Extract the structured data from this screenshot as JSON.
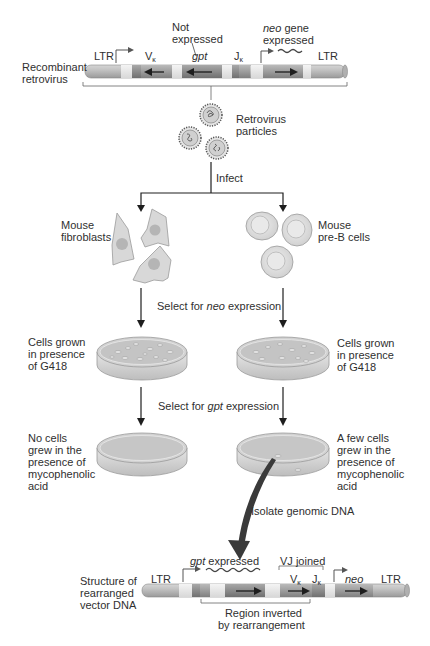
{
  "top_construct": {
    "name_line1": "Recombinant",
    "name_line2": "retrovirus",
    "ltr_left": "LTR",
    "ltr_right": "LTR",
    "v_label": "V",
    "j_label": "J",
    "kappa": "κ",
    "gpt_label": "gpt",
    "not_expressed_line1": "Not",
    "not_expressed_line2": "expressed",
    "neo_label": "neo",
    "neo_expressed_rest": " gene",
    "neo_expressed_line2": "expressed"
  },
  "particles": {
    "line1": "Retrovirus",
    "line2": "particles"
  },
  "infect_label": "Infect",
  "left_branch": {
    "cells_line1": "Mouse",
    "cells_line2": "fibroblasts",
    "plate1_line1": "Cells grown",
    "plate1_line2": "in presence",
    "plate1_line3": "of G418",
    "plate2_line1": "No cells",
    "plate2_line2": "grew in the",
    "plate2_line3": "presence of",
    "plate2_line4": "mycophenolic",
    "plate2_line5": "acid"
  },
  "right_branch": {
    "cells_line1": "Mouse",
    "cells_line2": "pre-B cells",
    "plate1_line1": "Cells grown",
    "plate1_line2": "in presence",
    "plate1_line3": "of G418",
    "plate2_line1": "A few cells",
    "plate2_line2": "grew in the",
    "plate2_line3": "presence of",
    "plate2_line4": "mycophenolic",
    "plate2_line5": "acid"
  },
  "steps": {
    "select_neo_prefix": "Select for ",
    "select_neo_gene": "neo",
    "select_neo_suffix": " expression",
    "select_gpt_prefix": "Select for ",
    "select_gpt_gene": "gpt",
    "select_gpt_suffix": " expression",
    "isolate": "Isolate genomic DNA"
  },
  "bottom_construct": {
    "name_line1": "Structure of",
    "name_line2": "rearranged",
    "name_line3": "vector DNA",
    "ltr_left": "LTR",
    "ltr_right": "LTR",
    "gpt_gene": "gpt",
    "gpt_expressed_rest": " expressed",
    "vj_joined": "VJ joined",
    "v_label": "V",
    "j_label": "J",
    "kappa": "κ",
    "neo_label": "neo",
    "region_line1": "Region inverted",
    "region_line2": "by rearrangement"
  },
  "colors": {
    "tube_base": "#b9b9b9",
    "tube_light": "#e6e6e6",
    "segment_dark": "#8e8e8e",
    "segment_mid": "#a5a5a5",
    "cell_fill": "#d8d8d8",
    "arrow": "#1e1e1e",
    "thick_arrow": "#3a3a3a"
  }
}
